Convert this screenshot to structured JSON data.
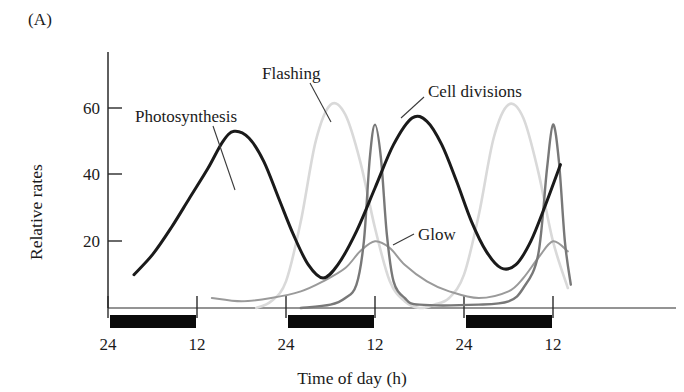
{
  "figure": {
    "panel_letter": "(A)",
    "xlabel": "Time of day (h)",
    "ylabel": "Relative rates"
  },
  "labels": {
    "photosynthesis": "Photosynthesis",
    "flashing": "Flashing",
    "cell_divisions": "Cell divisions",
    "glow": "Glow"
  },
  "ticks": {
    "y": [
      "20",
      "40",
      "60"
    ],
    "y_20": "20",
    "y_40": "40",
    "y_60": "60",
    "x": [
      "24",
      "12",
      "24",
      "12",
      "24",
      "12"
    ],
    "x_0": "24",
    "x_1": "12",
    "x_2": "24",
    "x_3": "12",
    "x_4": "24",
    "x_5": "12"
  },
  "colors": {
    "photosynthesis": "#1a1a1a",
    "flashing": "#d9d9d9",
    "cell_divisions": "#787878",
    "glow": "#9a9a9a",
    "axis": "#2a2a2a",
    "night_bar": "#0a0a0a",
    "background": "#ffffff"
  },
  "chart_data": {
    "type": "line",
    "title": "",
    "xlabel": "Time of day (h)",
    "ylabel": "Relative rates",
    "xlim": [
      24,
      60
    ],
    "ylim": [
      0,
      70
    ],
    "ytick_values": [
      20,
      40,
      60
    ],
    "xtick_values": [
      24,
      36,
      48,
      60,
      72,
      84
    ],
    "xtick_labels": [
      "24",
      "12",
      "24",
      "12",
      "24",
      "12"
    ],
    "grid": false,
    "legend": "inline-annotations",
    "night_bars": [
      {
        "start_hour": 24,
        "end_hour": 36,
        "label": "dark period"
      },
      {
        "start_hour": 48,
        "end_hour": 60,
        "label": "dark period"
      },
      {
        "start_hour": 72,
        "end_hour": 84,
        "label": "dark period"
      }
    ],
    "series": [
      {
        "name": "Photosynthesis",
        "color": "#1a1a1a",
        "peak_value": 53,
        "peak_times_h": [
          41,
          65
        ],
        "trough_value": 8,
        "trough_times_h": [
          29,
          53
        ],
        "description": "broad smooth daytime maximum, minimum during dark period",
        "points": [
          {
            "x": 27.5,
            "y": 10
          },
          {
            "x": 30,
            "y": 16
          },
          {
            "x": 32.5,
            "y": 24
          },
          {
            "x": 35,
            "y": 33
          },
          {
            "x": 37.5,
            "y": 42
          },
          {
            "x": 39.5,
            "y": 50
          },
          {
            "x": 41,
            "y": 53
          },
          {
            "x": 43,
            "y": 51
          },
          {
            "x": 45,
            "y": 44
          },
          {
            "x": 47,
            "y": 33
          },
          {
            "x": 49,
            "y": 22
          },
          {
            "x": 51,
            "y": 13
          },
          {
            "x": 53,
            "y": 9
          },
          {
            "x": 55,
            "y": 13
          },
          {
            "x": 57.5,
            "y": 23
          },
          {
            "x": 60,
            "y": 36
          },
          {
            "x": 62.5,
            "y": 49
          },
          {
            "x": 65,
            "y": 57
          },
          {
            "x": 67,
            "y": 56
          },
          {
            "x": 69,
            "y": 49
          },
          {
            "x": 71,
            "y": 38
          },
          {
            "x": 73,
            "y": 26
          },
          {
            "x": 75,
            "y": 17
          },
          {
            "x": 77,
            "y": 12
          },
          {
            "x": 79,
            "y": 13
          },
          {
            "x": 81,
            "y": 20
          },
          {
            "x": 83,
            "y": 31
          },
          {
            "x": 85,
            "y": 43
          }
        ]
      },
      {
        "name": "Flashing",
        "color": "#d9d9d9",
        "peak_value": 61,
        "peak_times_h": [
          54,
          78
        ],
        "trough_value": 0,
        "description": "broad bell-shaped maximum centred in the dark period",
        "points": [
          {
            "x": 44,
            "y": 0
          },
          {
            "x": 46,
            "y": 2
          },
          {
            "x": 48,
            "y": 8
          },
          {
            "x": 50,
            "y": 26
          },
          {
            "x": 52,
            "y": 50
          },
          {
            "x": 54,
            "y": 61
          },
          {
            "x": 56,
            "y": 58
          },
          {
            "x": 58,
            "y": 44
          },
          {
            "x": 60,
            "y": 24
          },
          {
            "x": 62,
            "y": 8
          },
          {
            "x": 64,
            "y": 2
          },
          {
            "x": 66,
            "y": 0
          },
          {
            "x": 68,
            "y": 1
          },
          {
            "x": 70,
            "y": 3
          },
          {
            "x": 72,
            "y": 10
          },
          {
            "x": 74,
            "y": 28
          },
          {
            "x": 76,
            "y": 51
          },
          {
            "x": 78,
            "y": 61
          },
          {
            "x": 80,
            "y": 57
          },
          {
            "x": 82,
            "y": 41
          },
          {
            "x": 84,
            "y": 20
          },
          {
            "x": 86,
            "y": 6
          }
        ]
      },
      {
        "name": "Cell divisions",
        "color": "#787878",
        "peak_value": 55,
        "peak_times_h": [
          60,
          84
        ],
        "trough_value": 0,
        "description": "sharp narrow spike at end of the dark period (dawn)",
        "points": [
          {
            "x": 50,
            "y": 0
          },
          {
            "x": 54,
            "y": 1
          },
          {
            "x": 56,
            "y": 3
          },
          {
            "x": 57.5,
            "y": 7
          },
          {
            "x": 58.5,
            "y": 20
          },
          {
            "x": 59.3,
            "y": 45
          },
          {
            "x": 60,
            "y": 55
          },
          {
            "x": 60.8,
            "y": 45
          },
          {
            "x": 61.6,
            "y": 22
          },
          {
            "x": 62.5,
            "y": 8
          },
          {
            "x": 64,
            "y": 3
          },
          {
            "x": 66,
            "y": 1
          },
          {
            "x": 74,
            "y": 1
          },
          {
            "x": 78,
            "y": 2
          },
          {
            "x": 80,
            "y": 6
          },
          {
            "x": 82,
            "y": 16
          },
          {
            "x": 83.2,
            "y": 42
          },
          {
            "x": 84,
            "y": 55
          },
          {
            "x": 84.8,
            "y": 44
          },
          {
            "x": 85.6,
            "y": 20
          },
          {
            "x": 86.4,
            "y": 7
          }
        ]
      },
      {
        "name": "Glow",
        "color": "#9a9a9a",
        "peak_value": 20,
        "peak_times_h": [
          60,
          84
        ],
        "trough_value": 0,
        "description": "low broad maximum at the end of the dark period",
        "points": [
          {
            "x": 38,
            "y": 3
          },
          {
            "x": 42,
            "y": 2
          },
          {
            "x": 46,
            "y": 3
          },
          {
            "x": 50,
            "y": 5
          },
          {
            "x": 53,
            "y": 8
          },
          {
            "x": 56,
            "y": 12
          },
          {
            "x": 58,
            "y": 17
          },
          {
            "x": 60,
            "y": 20
          },
          {
            "x": 62,
            "y": 18
          },
          {
            "x": 64,
            "y": 13
          },
          {
            "x": 67,
            "y": 8
          },
          {
            "x": 70,
            "y": 5
          },
          {
            "x": 74,
            "y": 3
          },
          {
            "x": 78,
            "y": 5
          },
          {
            "x": 80,
            "y": 9
          },
          {
            "x": 82,
            "y": 15
          },
          {
            "x": 84,
            "y": 20
          },
          {
            "x": 86,
            "y": 17
          }
        ]
      }
    ]
  }
}
